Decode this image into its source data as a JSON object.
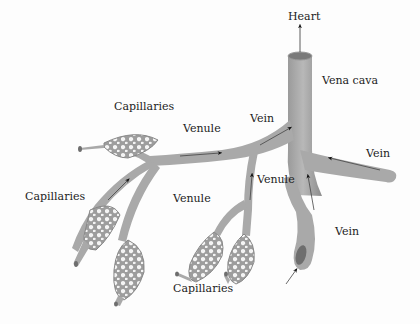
{
  "diagram": {
    "type": "anatomical-illustration",
    "colors": {
      "vessel": "#a9a9a9",
      "vessel_dark": "#8a8a8a",
      "vessel_light": "#c4c4c4",
      "lumen": "#6e6e6e",
      "arrow": "#111111",
      "label_text": "#222222",
      "background": "#fdfdfd"
    },
    "labels": {
      "heart": "Heart",
      "vena_cava": "Vena cava",
      "vein_top": "Vein",
      "vein_right": "Vein",
      "vein_bottom": "Vein",
      "venule_top": "Venule",
      "venule_middle": "Venule",
      "venule_right": "Venule",
      "capillaries_top": "Capillaries",
      "capillaries_left": "Capillaries",
      "capillaries_bottom": "Capillaries"
    },
    "flow_direction": "capillaries → venules → veins → vena cava → heart"
  }
}
